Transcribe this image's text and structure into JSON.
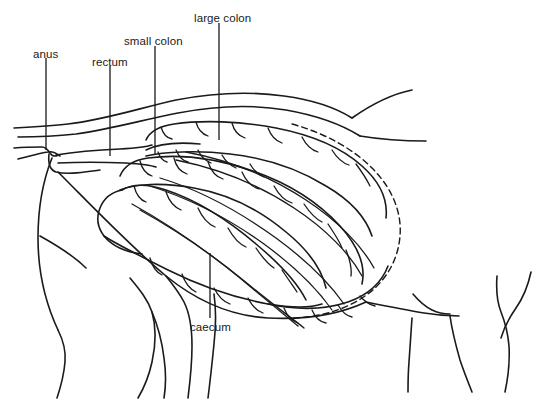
{
  "figure": {
    "name": "horse-hindgut-anatomy-diagram",
    "background_color": "#ffffff",
    "stroke_color": "#1a1a1a",
    "width": 543,
    "height": 402
  },
  "labels": [
    {
      "id": "anus",
      "text": "anus",
      "text_x": 33,
      "text_y": 49,
      "leader": {
        "x1": 46,
        "y1": 58,
        "x2": 46,
        "y2": 150
      }
    },
    {
      "id": "rectum",
      "text": "rectum",
      "text_x": 92,
      "text_y": 57,
      "leader": {
        "x1": 110,
        "y1": 66,
        "x2": 110,
        "y2": 156
      }
    },
    {
      "id": "small-colon",
      "text": "small colon",
      "text_x": 124,
      "text_y": 36,
      "leader": {
        "x1": 155,
        "y1": 46,
        "x2": 155,
        "y2": 155
      }
    },
    {
      "id": "large-colon",
      "text": "large colon",
      "text_x": 194,
      "text_y": 13,
      "leader": {
        "x1": 219,
        "y1": 23,
        "x2": 219,
        "y2": 140
      }
    },
    {
      "id": "caecum",
      "text": "caecum",
      "text_x": 190,
      "text_y": 322,
      "leader": {
        "x1": 210,
        "y1": 253,
        "x2": 210,
        "y2": 318
      }
    }
  ]
}
